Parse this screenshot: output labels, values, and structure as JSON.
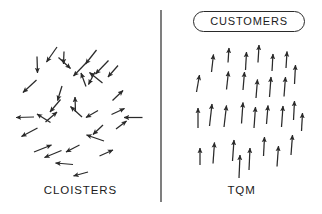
{
  "figure": {
    "type": "diagram",
    "subtype": "vector-alignment-comparison",
    "background_color": "#ffffff",
    "width": 322,
    "height": 214,
    "stroke_color": "#2a2a2a",
    "text_color": "#1b1b1b"
  },
  "divider": {
    "orientation": "vertical",
    "x": 161,
    "y1": 10,
    "y2": 202,
    "color": "#3a3a3a",
    "width": 1.3
  },
  "badge": {
    "label": "CUSTOMERS",
    "shape": "stadium",
    "x": 193,
    "y": 11,
    "width": 112,
    "height": 21,
    "border_color": "#2a2a2a",
    "fill": "#ffffff"
  },
  "panels": [
    {
      "id": "left",
      "caption": "CLOISTERS",
      "meaning": "arrows point in random, unaligned directions",
      "arrow_count": 30,
      "arrow_color": "#2a2a2a"
    },
    {
      "id": "right",
      "caption": "TQM",
      "meaning": "arrows aligned pointing upward toward the customers badge",
      "arrow_count": 30,
      "arrow_color": "#2a2a2a"
    }
  ],
  "arrows": {
    "left_random": [
      {
        "x1": 36.5,
        "y1": 80.0,
        "x2": 23.0,
        "y2": 92.5
      },
      {
        "x1": 34.0,
        "y1": 117.0,
        "x2": 16.0,
        "y2": 117.5
      },
      {
        "x1": 37.5,
        "y1": 128.0,
        "x2": 21.5,
        "y2": 136.5
      },
      {
        "x1": 50.5,
        "y1": 122.5,
        "x2": 37.0,
        "y2": 114.0
      },
      {
        "x1": 37.0,
        "y1": 56.5,
        "x2": 37.5,
        "y2": 73.0
      },
      {
        "x1": 57.0,
        "y1": 47.0,
        "x2": 46.5,
        "y2": 62.0
      },
      {
        "x1": 45.5,
        "y1": 122.0,
        "x2": 57.0,
        "y2": 112.0
      },
      {
        "x1": 34.0,
        "y1": 152.0,
        "x2": 51.5,
        "y2": 145.0
      },
      {
        "x1": 61.5,
        "y1": 150.5,
        "x2": 44.5,
        "y2": 157.5
      },
      {
        "x1": 73.0,
        "y1": 164.5,
        "x2": 55.5,
        "y2": 163.0
      },
      {
        "x1": 88.0,
        "y1": 172.0,
        "x2": 73.5,
        "y2": 176.0
      },
      {
        "x1": 60.5,
        "y1": 99.5,
        "x2": 50.0,
        "y2": 112.0
      },
      {
        "x1": 62.0,
        "y1": 86.0,
        "x2": 57.5,
        "y2": 100.5
      },
      {
        "x1": 58.5,
        "y1": 57.5,
        "x2": 70.5,
        "y2": 68.5
      },
      {
        "x1": 64.0,
        "y1": 51.5,
        "x2": 63.5,
        "y2": 64.0
      },
      {
        "x1": 82.0,
        "y1": 117.0,
        "x2": 70.5,
        "y2": 106.5
      },
      {
        "x1": 86.0,
        "y1": 63.0,
        "x2": 73.5,
        "y2": 76.0
      },
      {
        "x1": 75.5,
        "y1": 112.0,
        "x2": 75.0,
        "y2": 97.0
      },
      {
        "x1": 86.0,
        "y1": 86.5,
        "x2": 81.0,
        "y2": 73.0
      },
      {
        "x1": 79.5,
        "y1": 145.0,
        "x2": 66.0,
        "y2": 152.0
      },
      {
        "x1": 96.5,
        "y1": 50.0,
        "x2": 85.5,
        "y2": 64.0
      },
      {
        "x1": 95.0,
        "y1": 72.0,
        "x2": 88.5,
        "y2": 84.5
      },
      {
        "x1": 102.5,
        "y1": 83.0,
        "x2": 89.5,
        "y2": 72.5
      },
      {
        "x1": 108.5,
        "y1": 60.5,
        "x2": 95.5,
        "y2": 74.0
      },
      {
        "x1": 104.0,
        "y1": 141.0,
        "x2": 86.5,
        "y2": 135.0
      },
      {
        "x1": 98.0,
        "y1": 110.5,
        "x2": 86.0,
        "y2": 117.5
      },
      {
        "x1": 103.0,
        "y1": 125.0,
        "x2": 93.0,
        "y2": 134.5
      },
      {
        "x1": 99.5,
        "y1": 156.0,
        "x2": 113.0,
        "y2": 150.0
      },
      {
        "x1": 118.0,
        "y1": 65.5,
        "x2": 108.0,
        "y2": 77.0
      },
      {
        "x1": 112.5,
        "y1": 100.5,
        "x2": 123.0,
        "y2": 90.5
      },
      {
        "x1": 116.0,
        "y1": 129.0,
        "x2": 126.5,
        "y2": 121.0
      },
      {
        "x1": 111.5,
        "y1": 114.5,
        "x2": 124.5,
        "y2": 108.5
      },
      {
        "x1": 142.5,
        "y1": 117.5,
        "x2": 124.0,
        "y2": 117.5
      }
    ],
    "right_aligned": [
      {
        "x1": 198.0,
        "y1": 128.0,
        "x2": 198.0,
        "y2": 108.0
      },
      {
        "x1": 196.5,
        "y1": 92.0,
        "x2": 199.5,
        "y2": 75.0
      },
      {
        "x1": 200.0,
        "y1": 165.0,
        "x2": 200.0,
        "y2": 148.0
      },
      {
        "x1": 209.5,
        "y1": 126.0,
        "x2": 212.0,
        "y2": 104.0
      },
      {
        "x1": 211.5,
        "y1": 72.0,
        "x2": 213.5,
        "y2": 54.5
      },
      {
        "x1": 213.0,
        "y1": 163.5,
        "x2": 214.5,
        "y2": 142.5
      },
      {
        "x1": 226.5,
        "y1": 89.5,
        "x2": 228.5,
        "y2": 71.5
      },
      {
        "x1": 224.0,
        "y1": 127.0,
        "x2": 226.5,
        "y2": 105.5
      },
      {
        "x1": 228.0,
        "y1": 62.5,
        "x2": 229.0,
        "y2": 48.0
      },
      {
        "x1": 232.5,
        "y1": 161.0,
        "x2": 234.0,
        "y2": 140.0
      },
      {
        "x1": 239.0,
        "y1": 178.0,
        "x2": 240.0,
        "y2": 155.0
      },
      {
        "x1": 241.5,
        "y1": 123.5,
        "x2": 243.0,
        "y2": 102.5
      },
      {
        "x1": 243.0,
        "y1": 90.0,
        "x2": 244.5,
        "y2": 72.0
      },
      {
        "x1": 245.5,
        "y1": 70.0,
        "x2": 246.5,
        "y2": 52.0
      },
      {
        "x1": 249.0,
        "y1": 170.0,
        "x2": 250.0,
        "y2": 148.0
      },
      {
        "x1": 254.0,
        "y1": 128.0,
        "x2": 255.5,
        "y2": 107.0
      },
      {
        "x1": 256.0,
        "y1": 98.0,
        "x2": 257.5,
        "y2": 79.5
      },
      {
        "x1": 258.0,
        "y1": 62.5,
        "x2": 259.0,
        "y2": 45.0
      },
      {
        "x1": 263.5,
        "y1": 156.0,
        "x2": 264.5,
        "y2": 137.0
      },
      {
        "x1": 266.5,
        "y1": 124.0,
        "x2": 268.0,
        "y2": 105.5
      },
      {
        "x1": 269.5,
        "y1": 97.0,
        "x2": 271.0,
        "y2": 77.0
      },
      {
        "x1": 272.0,
        "y1": 71.0,
        "x2": 273.0,
        "y2": 54.0
      },
      {
        "x1": 277.0,
        "y1": 166.5,
        "x2": 278.5,
        "y2": 146.0
      },
      {
        "x1": 281.5,
        "y1": 127.0,
        "x2": 283.0,
        "y2": 106.0
      },
      {
        "x1": 284.0,
        "y1": 96.5,
        "x2": 285.5,
        "y2": 77.0
      },
      {
        "x1": 286.0,
        "y1": 68.0,
        "x2": 287.0,
        "y2": 51.5
      },
      {
        "x1": 291.0,
        "y1": 155.0,
        "x2": 292.5,
        "y2": 135.0
      },
      {
        "x1": 293.5,
        "y1": 120.0,
        "x2": 294.5,
        "y2": 101.0
      },
      {
        "x1": 294.5,
        "y1": 84.0,
        "x2": 295.5,
        "y2": 65.0
      },
      {
        "x1": 301.5,
        "y1": 131.0,
        "x2": 302.5,
        "y2": 113.0
      }
    ]
  }
}
